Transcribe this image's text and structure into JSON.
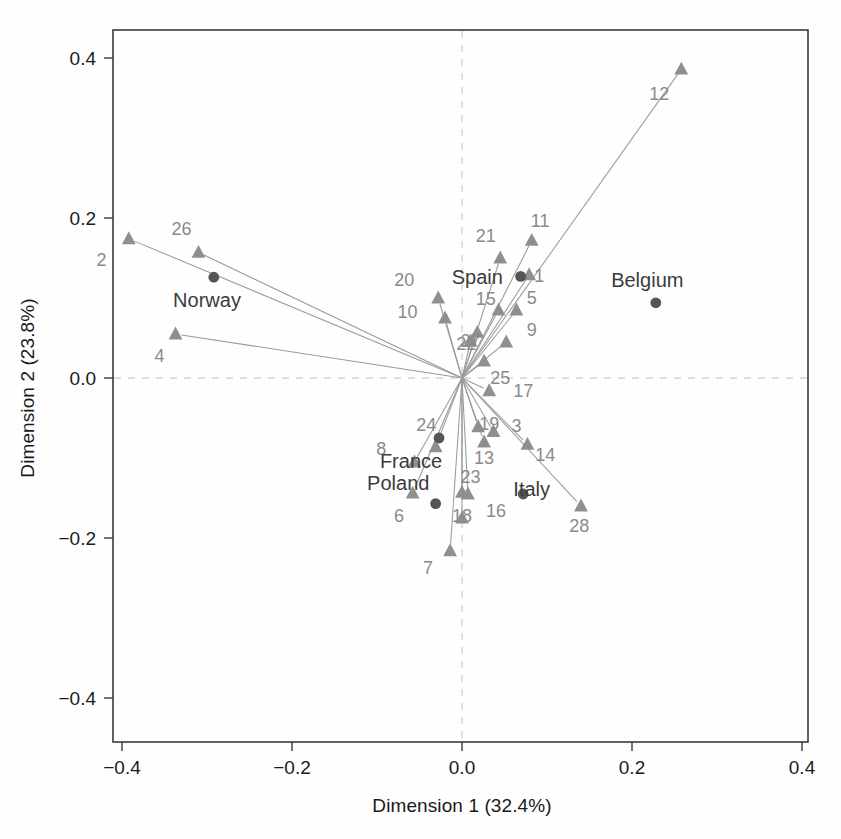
{
  "figure": {
    "title": "",
    "background": "#fefefe",
    "ray_color": "#9b9b9b",
    "variable_marker_color": "#8f8f8f",
    "individual_marker_color": "#555555",
    "axis_color": "#3a3a3a",
    "zeroline_color": "#d2d2d2"
  },
  "chart_data": {
    "type": "scatter",
    "title": "",
    "subtitle": "",
    "xlabel": "Dimension 1 (32.4%)",
    "ylabel": "Dimension 2 (23.8%)",
    "xlim": [
      -0.45,
      0.43
    ],
    "ylim": [
      -0.45,
      0.43
    ],
    "xticks": [
      -0.4,
      -0.2,
      0.0,
      0.2,
      0.4
    ],
    "xticklabels": [
      "-0.4",
      "-0.2",
      "0.0",
      "0.2",
      "0.4"
    ],
    "yticks": [
      -0.4,
      -0.2,
      0.0,
      0.2,
      0.4
    ],
    "yticklabels": [
      "-0.4",
      "-0.2",
      "0.0",
      "0.2",
      "0.4"
    ],
    "grid": false,
    "legend": "none",
    "zero_reference_lines": {
      "x": 0.0,
      "y": 0.0,
      "style": "dashed"
    },
    "origin": [
      0.0,
      0.0
    ],
    "variables_note": "Numbered variable vectors drawn as rays from the origin, ending in filled triangles.",
    "series": [
      {
        "name": "Variables (numbered rays)",
        "marker": "triangle",
        "color": "#8f8f8f",
        "points": [
          {
            "label": "2",
            "x": -0.392,
            "y": 0.174,
            "lx": -0.424,
            "ly": 0.147
          },
          {
            "label": "26",
            "x": -0.31,
            "y": 0.157,
            "lx": -0.33,
            "ly": 0.186
          },
          {
            "label": "4",
            "x": -0.337,
            "y": 0.055,
            "lx": -0.356,
            "ly": 0.027
          },
          {
            "label": "20",
            "x": -0.028,
            "y": 0.1,
            "lx": -0.068,
            "ly": 0.122
          },
          {
            "label": "10",
            "x": -0.02,
            "y": 0.075,
            "lx": -0.064,
            "ly": 0.083
          },
          {
            "label": "21",
            "x": 0.045,
            "y": 0.15,
            "lx": 0.028,
            "ly": 0.177
          },
          {
            "label": "11",
            "x": 0.082,
            "y": 0.172,
            "lx": 0.092,
            "ly": 0.196
          },
          {
            "label": "1",
            "x": 0.079,
            "y": 0.129,
            "lx": 0.091,
            "ly": 0.128
          },
          {
            "label": "12",
            "x": 0.258,
            "y": 0.386,
            "lx": 0.232,
            "ly": 0.355
          },
          {
            "label": "15",
            "x": 0.043,
            "y": 0.085,
            "lx": 0.028,
            "ly": 0.099
          },
          {
            "label": "5",
            "x": 0.064,
            "y": 0.085,
            "lx": 0.082,
            "ly": 0.1
          },
          {
            "label": "9",
            "x": 0.052,
            "y": 0.045,
            "lx": 0.082,
            "ly": 0.06
          },
          {
            "label": "22",
            "x": 0.018,
            "y": 0.057,
            "lx": 0.005,
            "ly": 0.043
          },
          {
            "label": "25",
            "x": 0.026,
            "y": 0.021,
            "lx": 0.045,
            "ly": 0.0
          },
          {
            "label": "17",
            "x": 0.032,
            "y": -0.016,
            "lx": 0.072,
            "ly": -0.016
          },
          {
            "label": "24",
            "x": -0.031,
            "y": -0.086,
            "lx": -0.042,
            "ly": -0.059
          },
          {
            "label": "19",
            "x": 0.019,
            "y": -0.061,
            "lx": 0.032,
            "ly": -0.057
          },
          {
            "label": "3",
            "x": 0.037,
            "y": -0.067,
            "lx": 0.064,
            "ly": -0.06
          },
          {
            "label": "13",
            "x": 0.026,
            "y": -0.08,
            "lx": 0.026,
            "ly": -0.1
          },
          {
            "label": "14",
            "x": 0.077,
            "y": -0.083,
            "lx": 0.098,
            "ly": -0.096
          },
          {
            "label": "8",
            "x": -0.056,
            "y": -0.105,
            "lx": -0.095,
            "ly": -0.089
          },
          {
            "label": "6",
            "x": -0.058,
            "y": -0.144,
            "lx": -0.074,
            "ly": -0.172
          },
          {
            "label": "23",
            "x": 0.007,
            "y": -0.145,
            "lx": 0.01,
            "ly": -0.124
          },
          {
            "label": "16",
            "x": 0.0,
            "y": -0.175,
            "lx": 0.04,
            "ly": -0.166
          },
          {
            "label": "18",
            "x": 0.0,
            "y": -0.143,
            "lx": 0.0,
            "ly": -0.172
          },
          {
            "label": "7",
            "x": -0.014,
            "y": -0.216,
            "lx": -0.04,
            "ly": -0.238
          },
          {
            "label": "28",
            "x": 0.14,
            "y": -0.16,
            "lx": 0.138,
            "ly": -0.185
          },
          {
            "label": "27",
            "x": 0.01,
            "y": 0.046,
            "lx": 0.01,
            "ly": 0.046
          }
        ]
      },
      {
        "name": "Individuals (countries)",
        "marker": "circle",
        "color": "#555555",
        "points": [
          {
            "label": "Norway",
            "x": -0.292,
            "y": 0.126,
            "lx": -0.3,
            "ly": 0.098
          },
          {
            "label": "Spain",
            "x": 0.069,
            "y": 0.127,
            "lx": 0.018,
            "ly": 0.126
          },
          {
            "label": "Belgium",
            "x": 0.228,
            "y": 0.094,
            "lx": 0.218,
            "ly": 0.122
          },
          {
            "label": "France",
            "x": -0.027,
            "y": -0.075,
            "lx": -0.06,
            "ly": -0.104
          },
          {
            "label": "Poland",
            "x": -0.031,
            "y": -0.157,
            "lx": -0.075,
            "ly": -0.131
          },
          {
            "label": "Italy",
            "x": 0.072,
            "y": -0.145,
            "lx": 0.082,
            "ly": -0.139
          }
        ]
      }
    ]
  }
}
